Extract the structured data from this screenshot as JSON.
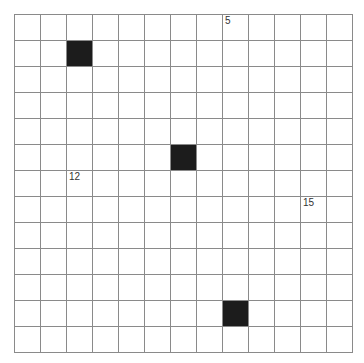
{
  "puzzle": {
    "type": "crossword-grid",
    "rows": 13,
    "cols": 13,
    "colors": {
      "grid_line": "#8a8a8a",
      "black_cell": "#1c1c1c",
      "white_cell": "#ffffff",
      "clue_number": "#333333"
    },
    "black_cells": [
      {
        "row": 1,
        "col": 2
      },
      {
        "row": 5,
        "col": 6
      },
      {
        "row": 11,
        "col": 8
      }
    ],
    "clue_numbers": [
      {
        "row": 0,
        "col": 8,
        "number": "5"
      },
      {
        "row": 6,
        "col": 2,
        "number": "12"
      },
      {
        "row": 7,
        "col": 11,
        "number": "15"
      }
    ]
  }
}
